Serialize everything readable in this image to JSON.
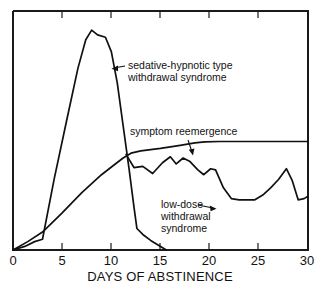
{
  "chart_data": {
    "type": "line",
    "title": "",
    "xlabel": "DAYS OF ABSTINENCE",
    "ylabel": "",
    "xlim": [
      0,
      30
    ],
    "ylim": [
      0,
      100
    ],
    "grid": false,
    "legend": "inline-annotations",
    "xticks": [
      0,
      5,
      10,
      15,
      20,
      25,
      30
    ],
    "xticklabels": [
      "0",
      "5",
      "10",
      "15",
      "20",
      "25",
      "30"
    ],
    "yticks": [],
    "yticklabels": [],
    "series": [
      {
        "name": "sedative-hypnotic type withdrawal syndrome",
        "x": [
          0,
          1.2,
          2.2,
          3.0,
          4.2,
          5.5,
          6.6,
          7.4,
          8.0,
          8.6,
          9.4,
          10.0,
          10.6,
          11.2,
          11.8,
          12.3,
          12.6,
          13.2,
          14.0,
          15.0,
          15.6
        ],
        "y": [
          0,
          1.5,
          3.5,
          4.5,
          30,
          55,
          76,
          88,
          92,
          90,
          89,
          83,
          70,
          52,
          34,
          18,
          9,
          6.5,
          4.0,
          1.5,
          0
        ]
      },
      {
        "name": "symptom reemergence",
        "x": [
          0,
          1.5,
          3.0,
          5.0,
          7.0,
          9.0,
          10.4,
          11.2,
          12.0,
          13.0,
          15.0,
          17.0,
          18.5,
          19.5,
          21.0,
          24.0,
          27.0,
          30.0
        ],
        "y": [
          0,
          3.5,
          7.5,
          15.5,
          24.0,
          31.5,
          36.0,
          38.5,
          40.5,
          41.5,
          42.5,
          43.8,
          44.8,
          45.2,
          45.4,
          45.4,
          45.4,
          45.4
        ]
      },
      {
        "name": "low-dose withdrawal syndrome",
        "x": [
          11.5,
          12.3,
          13.2,
          14.2,
          15.2,
          16.0,
          16.6,
          17.3,
          18.0,
          18.8,
          19.4,
          20.1,
          20.6,
          21.4,
          22.2,
          23.0,
          24.6,
          25.4,
          26.2,
          27.0,
          27.8,
          28.4,
          29.0,
          29.6,
          30.0
        ],
        "y": [
          40.0,
          34.5,
          35.0,
          32.0,
          36.5,
          39.0,
          36.0,
          38.5,
          37.0,
          33.5,
          31.5,
          34.0,
          33.5,
          26.0,
          21.5,
          21.0,
          21.0,
          23.0,
          26.0,
          29.5,
          34.0,
          29.0,
          21.0,
          21.5,
          22.5
        ]
      }
    ],
    "annotations": [
      {
        "id": "sedative-hypnotic-annotation",
        "lines": [
          "sedative-hypnotic type",
          "withdrawal syndrome"
        ],
        "arrow": "left"
      },
      {
        "id": "symptom-reemergence-annotation",
        "lines": [
          "symptom reemergence"
        ],
        "arrow": "down"
      },
      {
        "id": "low-dose-annotation",
        "lines": [
          "low-dose",
          "withdrawal",
          "syndrome"
        ],
        "arrow": "right"
      }
    ],
    "colors": {
      "curve": "#111111",
      "frame": "#1a1a1a",
      "background": "#ffffff",
      "text": "#111111"
    }
  }
}
